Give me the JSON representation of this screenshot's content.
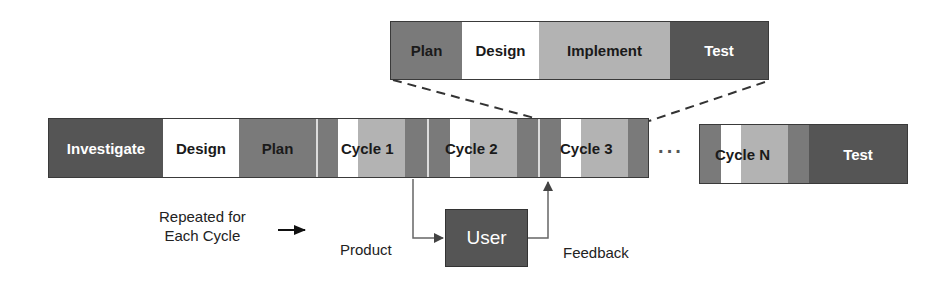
{
  "zoom_bar": {
    "phases": [
      {
        "label": "Plan",
        "shade": "mid"
      },
      {
        "label": "Design",
        "shade": "white"
      },
      {
        "label": "Implement",
        "shade": "light"
      },
      {
        "label": "Test",
        "shade": "dark"
      }
    ]
  },
  "main_bar": {
    "phases": [
      {
        "label": "Investigate",
        "shade": "dark"
      },
      {
        "label": "Design",
        "shade": "white"
      },
      {
        "label": "Plan",
        "shade": "mid"
      }
    ],
    "cycles": [
      {
        "label": "Cycle 1"
      },
      {
        "label": "Cycle 2"
      },
      {
        "label": "Cycle 3"
      }
    ],
    "ellipsis": "···"
  },
  "final_bar": {
    "cycle": {
      "label": "Cycle N"
    },
    "test": {
      "label": "Test"
    }
  },
  "feedback_loop": {
    "user_label": "User",
    "product_label": "Product",
    "feedback_label": "Feedback",
    "repeat_line1": "Repeated for",
    "repeat_line2": "Each Cycle"
  },
  "colors": {
    "dark": "#555555",
    "mid": "#7a7a7a",
    "light": "#b3b3b3",
    "white": "#ffffff"
  }
}
